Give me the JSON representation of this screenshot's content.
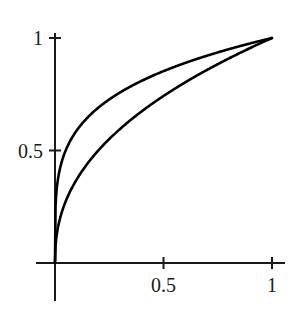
{
  "chart_data": {
    "type": "line",
    "title": "",
    "subtitle": "",
    "xlabel": "",
    "ylabel": "",
    "xlim": [
      0,
      1
    ],
    "ylim": [
      0,
      1
    ],
    "grid": false,
    "legend": "none",
    "annotations": [],
    "axis_color": "#1a1a1a",
    "curve_color": "#000000",
    "x_ticks": [
      {
        "value": 0.5,
        "label": "0.5"
      },
      {
        "value": 1,
        "label": "1"
      }
    ],
    "y_ticks": [
      {
        "value": 0.5,
        "label": "0.5"
      },
      {
        "value": 1,
        "label": "1"
      }
    ],
    "x": [
      0,
      0.01,
      0.02,
      0.04,
      0.06,
      0.08,
      0.1,
      0.15,
      0.2,
      0.25,
      0.3,
      0.35,
      0.4,
      0.45,
      0.5,
      0.55,
      0.6,
      0.65,
      0.7,
      0.75,
      0.8,
      0.85,
      0.9,
      0.95,
      1
    ],
    "series": [
      {
        "name": "upper-curve",
        "exponent": 0.23,
        "values": [
          0,
          0.35,
          0.41,
          0.48,
          0.53,
          0.56,
          0.59,
          0.65,
          0.69,
          0.72,
          0.75,
          0.77,
          0.8,
          0.82,
          0.83,
          0.85,
          0.87,
          0.88,
          0.9,
          0.91,
          0.93,
          0.94,
          0.96,
          0.97,
          1
        ]
      },
      {
        "name": "lower-curve",
        "exponent": 0.43,
        "values": [
          0,
          0.12,
          0.17,
          0.22,
          0.27,
          0.3,
          0.33,
          0.4,
          0.46,
          0.51,
          0.55,
          0.59,
          0.62,
          0.66,
          0.69,
          0.72,
          0.75,
          0.78,
          0.8,
          0.83,
          0.86,
          0.88,
          0.91,
          0.94,
          1
        ]
      }
    ]
  }
}
